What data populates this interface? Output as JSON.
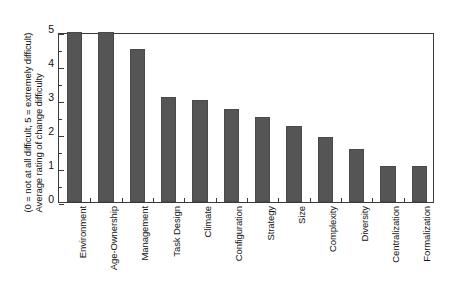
{
  "chart_data": {
    "type": "bar",
    "title": "",
    "xlabel": "",
    "ylabel_line1": "Average rating of change difficulty",
    "ylabel_line2": "(0 = not at all difficult, 5 = extremely difficult)",
    "ylim": [
      0,
      5
    ],
    "ytick_labels": [
      "0",
      "1",
      "2",
      "3",
      "4",
      "5"
    ],
    "ytick_values": [
      0,
      1,
      2,
      3,
      4,
      5
    ],
    "yminor_step": 0.5,
    "grid": false,
    "legend": null,
    "bar_color": "#555555",
    "frame_color": "#3a3a3a",
    "background": "#ffffff",
    "categories": [
      "Environment",
      "Age-Ownership",
      "Management",
      "Task Design",
      "Climate",
      "Configuration",
      "Strategy",
      "Size",
      "Complexity",
      "Diversity",
      "Centralization",
      "Formalization"
    ],
    "values": [
      5.0,
      5.0,
      4.5,
      3.1,
      3.0,
      2.75,
      2.5,
      2.25,
      1.9,
      1.55,
      1.05,
      1.05
    ]
  }
}
